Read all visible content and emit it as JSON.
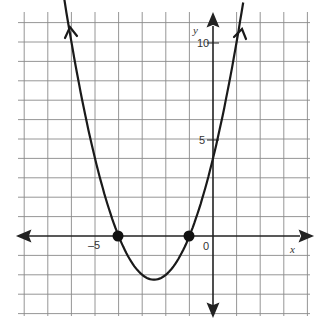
{
  "chart_data": {
    "type": "line",
    "title": "",
    "xlabel": "x",
    "ylabel": "y",
    "function": "y = x^2 + 5x + 4",
    "xlim": [
      -8,
      4
    ],
    "ylim": [
      -4,
      11
    ],
    "grid": true,
    "tick_labels": {
      "x": [
        "-5",
        "0"
      ],
      "y": [
        "5",
        "10"
      ]
    },
    "x": [
      -6.8,
      -6,
      -5,
      -4,
      -3,
      -2.5,
      -2,
      -1,
      0,
      1,
      1.3
    ],
    "series": [
      {
        "name": "parabola",
        "values": [
          11.24,
          10,
          4,
          0,
          -2,
          -2.25,
          -2,
          0,
          4,
          10,
          12.19
        ]
      }
    ],
    "points": [
      {
        "x": -4,
        "y": 0
      },
      {
        "x": -1,
        "y": 0
      }
    ],
    "vertex": {
      "x": -2.5,
      "y": -2.25
    },
    "y_intercept": 4
  },
  "labels": {
    "x_axis": "x",
    "y_axis": "y",
    "x_tick_neg5": "–5",
    "origin": "0",
    "y_tick_5": "5",
    "y_tick_10": "10"
  },
  "colors": {
    "curve": "#1a1a1a",
    "grid": "#8a8a8a",
    "axis": "#222222"
  }
}
